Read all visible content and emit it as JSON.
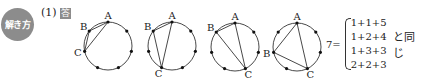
{
  "header": {
    "badge_label": "解き方",
    "question_number": "(1)",
    "answer_mark": "答"
  },
  "figures": {
    "points_per_circle": 7,
    "radius": 24,
    "items": [
      {
        "cx": 108,
        "cy": 46,
        "a": 0,
        "b": 6,
        "c": 5,
        "labels": {
          "A": "A",
          "B": "B",
          "C": "C"
        }
      },
      {
        "cx": 172,
        "cy": 46,
        "a": 0,
        "b": 6,
        "c": 4,
        "labels": {
          "A": "A",
          "B": "B",
          "C": "C"
        }
      },
      {
        "cx": 235,
        "cy": 47,
        "a": 0,
        "b": 6,
        "c": 3,
        "labels": {
          "A": "A",
          "B": "B",
          "C": "C"
        }
      },
      {
        "cx": 297,
        "cy": 47,
        "a": 0,
        "b": 5,
        "c": 3,
        "labels": {
          "A": "A",
          "B": "B",
          "C": "C"
        }
      }
    ]
  },
  "equation": {
    "lhs": "7=",
    "cases": [
      "1+1+5",
      "1+2+4",
      "1+3+3",
      "2+2+3"
    ],
    "suffix": "と同じ"
  }
}
